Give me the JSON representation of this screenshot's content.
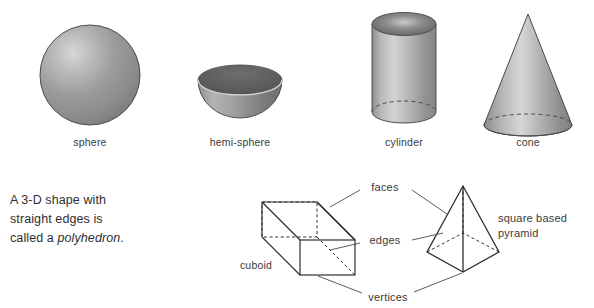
{
  "page": {
    "background_color": "#ffffff",
    "ink_color": "#3a3a3a"
  },
  "solids": [
    {
      "name": "sphere",
      "label": "sphere",
      "label_x": 90,
      "label_y": 142
    },
    {
      "name": "hemi-sphere",
      "label": "hemi-sphere",
      "label_x": 240,
      "label_y": 142
    },
    {
      "name": "cylinder",
      "label": "cylinder",
      "label_x": 404,
      "label_y": 142
    },
    {
      "name": "cone",
      "label": "cone",
      "label_x": 528,
      "label_y": 142
    }
  ],
  "note": {
    "line1": "A 3-D shape with",
    "line2": "straight edges is",
    "line3_prefix": "called a ",
    "line3_term": "polyhedron",
    "line3_suffix": "."
  },
  "polyhedra": {
    "cuboid_label": "cuboid",
    "pyramid_label_line1": "square based",
    "pyramid_label_line2": "pyramid"
  },
  "callouts": [
    {
      "name": "faces",
      "label": "faces",
      "x": 385,
      "y": 187
    },
    {
      "name": "edges",
      "label": "edges",
      "x": 385,
      "y": 240
    },
    {
      "name": "vertices",
      "label": "vertices",
      "x": 388,
      "y": 297
    }
  ]
}
